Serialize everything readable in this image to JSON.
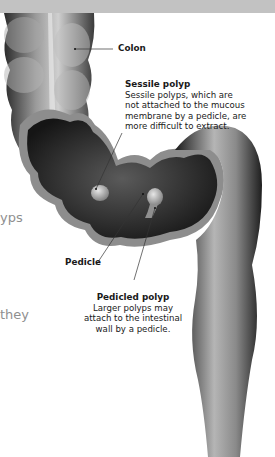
{
  "figure": {
    "labels": {
      "colon": {
        "title": "Colon"
      },
      "sessile": {
        "title": "Sessile polyp",
        "lines": [
          "Sessile polyps, which are",
          "not attached to the mucous",
          "membrane by a pedicle, are",
          "more difficult to extract."
        ]
      },
      "pedicle": {
        "title": "Pedicle"
      },
      "pedicled": {
        "title": "Pedicled polyp",
        "lines": [
          "Larger polyps may",
          "attach to the intestinal",
          "wall by a pedicle."
        ]
      }
    },
    "cut_off_text": [
      "yps",
      "they"
    ]
  },
  "colors": {
    "topbar": "#c2c2c2",
    "background": "#ffffff",
    "tissue_dark": "#1c1c1c",
    "tissue_mid": "#6e6e6e",
    "tissue_light": "#cfcfcf",
    "leader_line": "#333333",
    "left_text": "#8f8f8f"
  }
}
